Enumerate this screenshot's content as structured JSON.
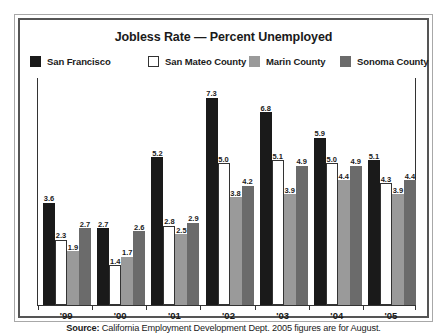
{
  "chart_data": {
    "type": "bar",
    "title": "Jobless Rate — Percent Unemployed",
    "xlabel": "",
    "ylabel": "",
    "ylim": [
      0,
      8.0
    ],
    "grid": false,
    "legend_position": "top",
    "categories": [
      "'99",
      "'00",
      "'01",
      "'02",
      "'03",
      "'04",
      "'05"
    ],
    "series": [
      {
        "name": "San Francisco",
        "color": "#1a1a1a",
        "values": [
          3.6,
          2.7,
          5.2,
          7.3,
          6.8,
          5.9,
          5.1
        ]
      },
      {
        "name": "San Mateo County",
        "color": "#ffffff",
        "values": [
          2.3,
          1.4,
          2.8,
          5.0,
          5.1,
          5.0,
          4.3
        ]
      },
      {
        "name": "Marin County",
        "color": "#9a9a9a",
        "values": [
          1.9,
          1.7,
          2.5,
          3.8,
          3.9,
          4.4,
          3.9
        ]
      },
      {
        "name": "Sonoma County",
        "color": "#6b6b6b",
        "values": [
          2.7,
          2.6,
          2.9,
          4.2,
          4.9,
          4.9,
          4.4
        ]
      }
    ],
    "annotations": {
      "source": "California Employment Development Dept. 2005 figures are for August."
    }
  },
  "footer": {
    "source_lead": "Source:",
    "source_text": " California Employment Development Dept. 2005 figures are for August."
  }
}
